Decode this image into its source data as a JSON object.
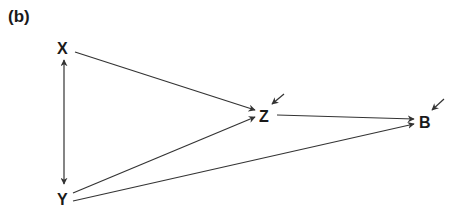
{
  "panel_label": "(b)",
  "nodes": {
    "X": {
      "label": "X"
    },
    "Y": {
      "label": "Y"
    },
    "Z": {
      "label": "Z"
    },
    "B": {
      "label": "B"
    }
  },
  "edges": [
    {
      "from": "X",
      "to": "Y",
      "type": "bidirected"
    },
    {
      "from": "X",
      "to": "Z",
      "type": "directed"
    },
    {
      "from": "Y",
      "to": "Z",
      "type": "directed"
    },
    {
      "from": "Z",
      "to": "B",
      "type": "directed"
    },
    {
      "from": "Y",
      "to": "B",
      "type": "directed"
    },
    {
      "from": "error",
      "to": "Z",
      "type": "exogenous"
    },
    {
      "from": "error",
      "to": "B",
      "type": "exogenous"
    }
  ],
  "colors": {
    "line": "#333333",
    "text": "#1a1a1a"
  }
}
